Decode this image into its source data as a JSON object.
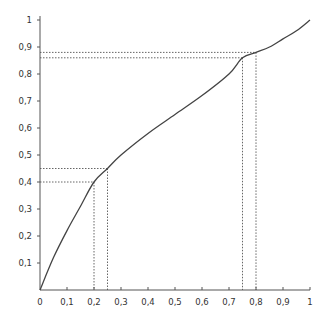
{
  "chart_data": {
    "type": "line",
    "title": "",
    "xlabel": "",
    "ylabel": "",
    "xlim": [
      0,
      1
    ],
    "ylim": [
      0,
      1
    ],
    "grid": false,
    "x_ticks": [
      0,
      0.1,
      0.2,
      0.3,
      0.4,
      0.5,
      0.6,
      0.7,
      0.8,
      0.9,
      1
    ],
    "x_tick_labels": [
      "0",
      "0,1",
      "0,2",
      "0,3",
      "0,4",
      "0,5",
      "0,6",
      "0,7",
      "0,8",
      "0,9",
      "1"
    ],
    "y_ticks": [
      0.1,
      0.2,
      0.3,
      0.4,
      0.5,
      0.6,
      0.7,
      0.8,
      0.9,
      1
    ],
    "y_tick_labels": [
      "0,1",
      "0,2",
      "0,3",
      "0,4",
      "0,5",
      "0,6",
      "0,7",
      "0,8",
      "0,9",
      "1"
    ],
    "series": [
      {
        "name": "curve",
        "x": [
          0,
          0.05,
          0.1,
          0.15,
          0.2,
          0.25,
          0.3,
          0.4,
          0.5,
          0.6,
          0.7,
          0.75,
          0.8,
          0.85,
          0.9,
          0.95,
          1
        ],
        "y": [
          0,
          0.12,
          0.22,
          0.31,
          0.4,
          0.45,
          0.5,
          0.58,
          0.65,
          0.72,
          0.8,
          0.86,
          0.88,
          0.9,
          0.93,
          0.96,
          1
        ]
      }
    ],
    "guides": [
      {
        "x": 0.2,
        "y": 0.4
      },
      {
        "x": 0.25,
        "y": 0.45
      },
      {
        "x": 0.75,
        "y": 0.86
      },
      {
        "x": 0.8,
        "y": 0.88
      }
    ]
  }
}
